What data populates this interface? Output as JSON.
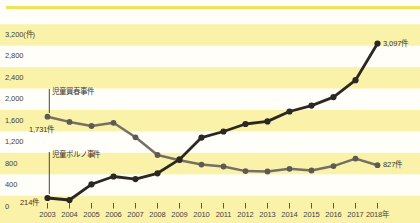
{
  "chart_data": {
    "type": "line",
    "title": "",
    "x_years": [
      2003,
      2004,
      2005,
      2006,
      2007,
      2008,
      2009,
      2010,
      2011,
      2012,
      2013,
      2014,
      2015,
      2016,
      2017,
      2018
    ],
    "x_tick_labels": [
      "2003",
      "2004",
      "2005",
      "2006",
      "2007",
      "2008",
      "2009",
      "2010",
      "2011",
      "2012",
      "2013",
      "2014",
      "2015",
      "2016",
      "2017",
      "2018年"
    ],
    "y_axis": {
      "ticks": [
        0,
        400,
        800,
        1200,
        1600,
        2000,
        2400,
        2800,
        3200
      ],
      "tick_labels": [
        "0",
        "400",
        "800",
        "1,200",
        "1,600",
        "2,000",
        "2,400",
        "2,800",
        "3,200(件)"
      ],
      "ylim": [
        0,
        3200
      ],
      "unit": "件"
    },
    "series": [
      {
        "name": "児童買春事件",
        "color": "#756f66",
        "marker_color": "#5e5951",
        "values": [
          1731,
          1634,
          1558,
          1618,
          1347,
          1016,
          917,
          837,
          802,
          717,
          709,
          760,
          728,
          809,
          950,
          827
        ],
        "first_value_label": "1,731件",
        "last_value_label": "827件"
      },
      {
        "name": "児童ポルノ事件",
        "color": "#2d2723",
        "marker_color": "#2d2723",
        "values": [
          214,
          177,
          470,
          616,
          567,
          676,
          935,
          1342,
          1455,
          1596,
          1644,
          1828,
          1938,
          2097,
          2413,
          3097
        ],
        "first_value_label": "214件",
        "last_value_label": "3,097件"
      }
    ],
    "background": {
      "style": "alternating horizontal 400-unit bands",
      "band_yellow": "#faf2a9",
      "band_white": "#fffef8"
    },
    "grid": "bands (no gridlines)",
    "legend_position": "inline annotations with leader lines"
  },
  "colors": {
    "top_bar": "#ece45c",
    "axis_text": "#46423c",
    "annotation_text": "#3a362f",
    "tick": "#5b564f",
    "leader_line": "#4a453f"
  }
}
